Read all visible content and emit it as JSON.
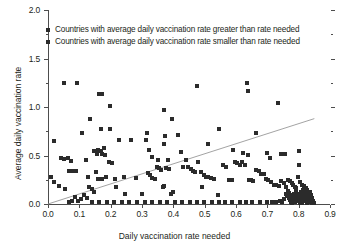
{
  "chart_data": {
    "type": "scatter",
    "title": "",
    "xlabel": "Daily vaccination rate needed",
    "ylabel": "Average daily vaccination rate",
    "xlim": [
      0.0,
      0.9
    ],
    "ylim": [
      0.0,
      2.0
    ],
    "grid": false,
    "legend_position": "top-left",
    "x_ticks": [
      "0.0",
      "0.1",
      "0.2",
      "0.3",
      "0.4",
      "0.5",
      "0.6",
      "0.7",
      "0.8",
      "0.9"
    ],
    "x_tick_values": [
      0.0,
      0.1,
      0.2,
      0.3,
      0.4,
      0.5,
      0.6,
      0.7,
      0.8,
      0.9
    ],
    "y_ticks": [
      "0.0",
      "0.5",
      "1.0",
      "1.5",
      "2.0"
    ],
    "y_tick_values": [
      0.0,
      0.5,
      1.0,
      1.5,
      2.0
    ],
    "y_minor_tick_values": [
      0.25,
      0.75,
      1.25,
      1.75
    ],
    "marker_color": "#2b2b2b",
    "axis_color": "#4d4d4d",
    "reference_line": {
      "label": "identity line",
      "color": "#8c8c8c",
      "x0": 0.0,
      "y0": 0.0,
      "x1": 0.85,
      "y1": 0.88
    },
    "legend": [
      {
        "label": "Countries with average daily vaccination rate greater than rate needed",
        "color": "#2b2b2b",
        "marker": "square"
      },
      {
        "label": "Countries with average daily vaccination rate smaller than rate needed",
        "color": "#2b2b2b",
        "marker": "square"
      }
    ],
    "series": [
      {
        "name": "Countries with average daily vaccination rate greater than rate needed",
        "color": "#2b2b2b",
        "points": [
          [
            0.05,
            1.245
          ],
          [
            0.093,
            1.245
          ],
          [
            0.163,
            1.135
          ],
          [
            0.172,
            1.135
          ],
          [
            0.198,
            1.015
          ],
          [
            0.133,
            0.88
          ],
          [
            0.168,
            0.775
          ],
          [
            0.197,
            0.775
          ],
          [
            0.11,
            0.73
          ],
          [
            0.228,
            0.655
          ],
          [
            0.264,
            0.655
          ],
          [
            0.317,
            0.73
          ],
          [
            0.313,
            0.655
          ],
          [
            0.322,
            0.56
          ],
          [
            0.369,
            0.965
          ],
          [
            0.372,
            0.7
          ],
          [
            0.37,
            0.62
          ],
          [
            0.331,
            0.48
          ],
          [
            0.352,
            0.455
          ],
          [
            0.382,
            0.455
          ],
          [
            0.397,
            0.875
          ],
          [
            0.416,
            0.715
          ],
          [
            0.425,
            0.535
          ],
          [
            0.02,
            0.65
          ],
          [
            0.04,
            0.47
          ],
          [
            0.052,
            0.465
          ],
          [
            0.063,
            0.47
          ],
          [
            0.072,
            0.445
          ],
          [
            0.068,
            0.345
          ],
          [
            0.078,
            0.345
          ],
          [
            0.088,
            0.345
          ],
          [
            0.12,
            0.45
          ],
          [
            0.128,
            0.275
          ],
          [
            0.148,
            0.545
          ],
          [
            0.155,
            0.52
          ],
          [
            0.16,
            0.56
          ],
          [
            0.168,
            0.545
          ],
          [
            0.172,
            0.52
          ],
          [
            0.178,
            0.575
          ],
          [
            0.183,
            0.51
          ],
          [
            0.01,
            0.275
          ],
          [
            0.018,
            0.225
          ],
          [
            0.035,
            0.19
          ],
          [
            0.055,
            0.15
          ],
          [
            0.152,
            0.33
          ],
          [
            0.16,
            0.26
          ],
          [
            0.172,
            0.255
          ],
          [
            0.186,
            0.28
          ],
          [
            0.196,
            0.43
          ],
          [
            0.205,
            0.425
          ],
          [
            0.213,
            0.26
          ],
          [
            0.218,
            0.175
          ],
          [
            0.243,
            0.275
          ],
          [
            0.247,
            0.105
          ],
          [
            0.282,
            0.27
          ],
          [
            0.3,
            0.105
          ],
          [
            0.318,
            0.32
          ],
          [
            0.326,
            0.295
          ],
          [
            0.333,
            0.27
          ],
          [
            0.34,
            0.255
          ],
          [
            0.347,
            0.385
          ],
          [
            0.354,
            0.37
          ],
          [
            0.36,
            0.35
          ],
          [
            0.366,
            0.175
          ],
          [
            0.371,
            0.185
          ],
          [
            0.378,
            0.375
          ],
          [
            0.385,
            0.36
          ],
          [
            0.392,
            0.105
          ],
          [
            0.4,
            0.125
          ]
        ]
      },
      {
        "name": "Countries with average daily vaccination rate smaller than rate needed",
        "color": "#2b2b2b",
        "points": [
          [
            0.477,
            1.22
          ],
          [
            0.634,
            1.245
          ],
          [
            0.637,
            1.165
          ],
          [
            0.735,
            1.045
          ],
          [
            0.545,
            0.775
          ],
          [
            0.663,
            0.73
          ],
          [
            0.512,
            0.62
          ],
          [
            0.592,
            0.56
          ],
          [
            0.622,
            0.53
          ],
          [
            0.638,
            0.51
          ],
          [
            0.7,
            0.53
          ],
          [
            0.707,
            0.47
          ],
          [
            0.745,
            0.52
          ],
          [
            0.757,
            0.52
          ],
          [
            0.8,
            0.545
          ],
          [
            0.8,
            0.4
          ],
          [
            0.44,
            0.455
          ],
          [
            0.432,
            0.38
          ],
          [
            0.447,
            0.38
          ],
          [
            0.455,
            0.36
          ],
          [
            0.463,
            0.34
          ],
          [
            0.47,
            0.335
          ],
          [
            0.478,
            0.43
          ],
          [
            0.487,
            0.325
          ],
          [
            0.497,
            0.3
          ],
          [
            0.492,
            0.18
          ],
          [
            0.505,
            0.28
          ],
          [
            0.512,
            0.275
          ],
          [
            0.52,
            0.265
          ],
          [
            0.53,
            0.26
          ],
          [
            0.543,
            0.09
          ],
          [
            0.558,
            0.4
          ],
          [
            0.568,
            0.385
          ],
          [
            0.578,
            0.25
          ],
          [
            0.588,
            0.245
          ],
          [
            0.596,
            0.43
          ],
          [
            0.604,
            0.42
          ],
          [
            0.612,
            0.4
          ],
          [
            0.62,
            0.43
          ],
          [
            0.628,
            0.405
          ],
          [
            0.64,
            0.245
          ],
          [
            0.648,
            0.245
          ],
          [
            0.655,
            0.24
          ],
          [
            0.665,
            0.35
          ],
          [
            0.672,
            0.34
          ],
          [
            0.68,
            0.31
          ],
          [
            0.688,
            0.305
          ],
          [
            0.695,
            0.255
          ],
          [
            0.702,
            0.25
          ],
          [
            0.712,
            0.23
          ],
          [
            0.72,
            0.2
          ],
          [
            0.728,
            0.195
          ],
          [
            0.736,
            0.19
          ],
          [
            0.744,
            0.24
          ],
          [
            0.752,
            0.215
          ],
          [
            0.758,
            0.175
          ],
          [
            0.765,
            0.25
          ],
          [
            0.772,
            0.235
          ],
          [
            0.778,
            0.215
          ],
          [
            0.783,
            0.2
          ],
          [
            0.788,
            0.18
          ],
          [
            0.793,
            0.16
          ],
          [
            0.798,
            0.275
          ],
          [
            0.804,
            0.225
          ],
          [
            0.81,
            0.195
          ],
          [
            0.816,
            0.19
          ],
          [
            0.822,
            0.165
          ],
          [
            0.828,
            0.14
          ],
          [
            0.758,
            0.1
          ],
          [
            0.763,
            0.08
          ],
          [
            0.768,
            0.06
          ],
          [
            0.772,
            0.04
          ],
          [
            0.776,
            0.025
          ],
          [
            0.78,
            0.015
          ],
          [
            0.784,
            0.105
          ],
          [
            0.788,
            0.085
          ],
          [
            0.792,
            0.065
          ],
          [
            0.796,
            0.05
          ],
          [
            0.8,
            0.03
          ],
          [
            0.804,
            0.012
          ],
          [
            0.766,
            0.135
          ],
          [
            0.77,
            0.115
          ],
          [
            0.775,
            0.095
          ],
          [
            0.779,
            0.07
          ],
          [
            0.783,
            0.045
          ],
          [
            0.787,
            0.022
          ],
          [
            0.791,
            0.125
          ],
          [
            0.795,
            0.1
          ],
          [
            0.799,
            0.078
          ],
          [
            0.803,
            0.055
          ],
          [
            0.807,
            0.035
          ],
          [
            0.811,
            0.015
          ],
          [
            0.806,
            0.12
          ],
          [
            0.81,
            0.095
          ],
          [
            0.814,
            0.07
          ],
          [
            0.818,
            0.05
          ],
          [
            0.822,
            0.03
          ],
          [
            0.826,
            0.012
          ],
          [
            0.813,
            0.14
          ],
          [
            0.817,
            0.11
          ],
          [
            0.821,
            0.085
          ],
          [
            0.825,
            0.06
          ],
          [
            0.829,
            0.038
          ],
          [
            0.833,
            0.018
          ],
          [
            0.83,
            0.1
          ],
          [
            0.834,
            0.075
          ],
          [
            0.838,
            0.05
          ],
          [
            0.841,
            0.028
          ],
          [
            0.844,
            0.012
          ],
          [
            0.836,
            0.125
          ],
          [
            0.84,
            0.095
          ],
          [
            0.843,
            0.062
          ],
          [
            0.846,
            0.035
          ],
          [
            0.848,
            0.015
          ],
          [
            0.742,
            0.035
          ],
          [
            0.748,
            0.02
          ],
          [
            0.752,
            0.055
          ],
          [
            0.728,
            0.018
          ],
          [
            0.716,
            0.022
          ],
          [
            0.7,
            0.02
          ],
          [
            0.676,
            0.02
          ],
          [
            0.652,
            0.022
          ],
          [
            0.632,
            0.018
          ],
          [
            0.612,
            0.02
          ],
          [
            0.588,
            0.022
          ],
          [
            0.566,
            0.018
          ],
          [
            0.545,
            0.02
          ],
          [
            0.522,
            0.018
          ],
          [
            0.498,
            0.02
          ],
          [
            0.474,
            0.018
          ],
          [
            0.452,
            0.02
          ],
          [
            0.428,
            0.018
          ],
          [
            0.404,
            0.02
          ],
          [
            0.38,
            0.018
          ],
          [
            0.356,
            0.02
          ],
          [
            0.332,
            0.018
          ],
          [
            0.308,
            0.02
          ],
          [
            0.284,
            0.018
          ],
          [
            0.26,
            0.02
          ],
          [
            0.236,
            0.018
          ],
          [
            0.212,
            0.02
          ],
          [
            0.188,
            0.018
          ],
          [
            0.164,
            0.02
          ],
          [
            0.14,
            0.022
          ],
          [
            0.124,
            0.06
          ],
          [
            0.116,
            0.095
          ],
          [
            0.104,
            0.055
          ],
          [
            0.096,
            0.03
          ],
          [
            0.086,
            0.075
          ],
          [
            0.078,
            0.028
          ],
          [
            0.068,
            0.02
          ],
          [
            0.132,
            0.175
          ],
          [
            0.14,
            0.15
          ],
          [
            0.146,
            0.12
          ]
        ]
      }
    ]
  }
}
